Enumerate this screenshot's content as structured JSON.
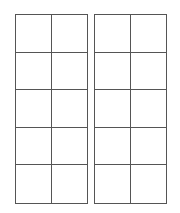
{
  "diagram": {
    "grids": [
      {
        "name": "left-grid",
        "rows": 5,
        "cols": 2,
        "left": 15
      },
      {
        "name": "right-grid",
        "rows": 5,
        "cols": 2,
        "left": 94
      }
    ],
    "line_color": "#555555"
  }
}
